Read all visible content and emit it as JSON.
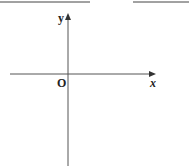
{
  "header": {
    "partial_text": "……",
    "blank_line_left": true,
    "blank_line_right": true
  },
  "diagram": {
    "type": "coordinate-axes",
    "x_axis_label": "x",
    "y_axis_label": "y",
    "origin_label": "O",
    "axis_color": "#555555"
  }
}
